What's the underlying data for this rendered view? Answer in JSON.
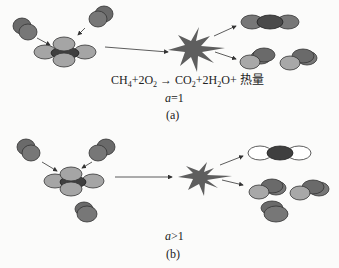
{
  "panel_a": {
    "equation": {
      "ch": "CH",
      "ch_sub": "4",
      "plus1": "+2O",
      "o2_sub": "2",
      "arrow": " → CO",
      "co2_sub": "2",
      "plus2": "+2H",
      "h2o_sub": "2",
      "tail": "O+ 热量"
    },
    "ratio_var": "a",
    "ratio_rel": "=1",
    "label": "(a)"
  },
  "panel_b": {
    "ratio_var": "a",
    "ratio_rel": ">1",
    "label": "(b)"
  },
  "colors": {
    "oxygen_dark": "#6f6f6f",
    "hydrogen_light": "#a9a9a9",
    "carbon_dark": "#3f3f3f",
    "explosion": "#5e5e5e",
    "outline": "#333333"
  }
}
